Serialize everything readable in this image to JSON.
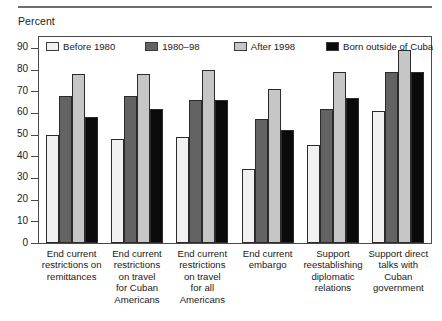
{
  "axis_title": "Percent",
  "legend": [
    {
      "label": "Before 1980",
      "icon": "legend-swatch-before-1980",
      "color": "#f1f1f1"
    },
    {
      "label": "1980–98",
      "icon": "legend-swatch-1980-98",
      "color": "#636363"
    },
    {
      "label": "After 1998",
      "icon": "legend-swatch-after-1998",
      "color": "#c6c6c6"
    },
    {
      "label": "Born outside of Cuba",
      "icon": "legend-swatch-born-outside-of-cuba",
      "color": "#0a0a0a"
    }
  ],
  "y_ticks": [
    "90",
    "80",
    "70",
    "60",
    "50",
    "40",
    "30",
    "20",
    "10",
    "0"
  ],
  "chart_data": {
    "type": "bar",
    "title": "",
    "subtitle": "",
    "xlabel": "",
    "ylabel": "Percent",
    "ylim": [
      0,
      95
    ],
    "yticks": [
      0,
      10,
      20,
      30,
      40,
      50,
      60,
      70,
      80,
      90
    ],
    "grid": false,
    "legend_position": "top-inside",
    "categories": [
      "End current restrictions on remittances",
      "End current restrictions on travel for Cuban Americans",
      "End current restrictions on travel for all Americans",
      "End current embargo",
      "Support reestablishing diplomatic relations",
      "Support direct talks with Cuban government"
    ],
    "category_lines": [
      [
        "End current",
        "restrictions on",
        "remittances"
      ],
      [
        "End current",
        "restrictions",
        "on travel",
        "for Cuban",
        "Americans"
      ],
      [
        "End current",
        "restrictions",
        "on travel",
        "for all",
        "Americans"
      ],
      [
        "End current",
        "embargo"
      ],
      [
        "Support",
        "reestablishing",
        "diplomatic",
        "relations"
      ],
      [
        "Support direct",
        "talks with",
        "Cuban",
        "government"
      ]
    ],
    "series": [
      {
        "name": "Before 1980",
        "color": "#f1f1f1",
        "values": [
          50,
          48,
          49,
          34,
          45,
          61
        ]
      },
      {
        "name": "1980–98",
        "color": "#636363",
        "values": [
          68,
          68,
          66,
          57,
          62,
          79
        ]
      },
      {
        "name": "After 1998",
        "color": "#c6c6c6",
        "values": [
          78,
          78,
          80,
          71,
          79,
          89
        ]
      },
      {
        "name": "Born outside of Cuba",
        "color": "#0a0a0a",
        "values": [
          58,
          62,
          66,
          52,
          67,
          79
        ]
      }
    ]
  }
}
